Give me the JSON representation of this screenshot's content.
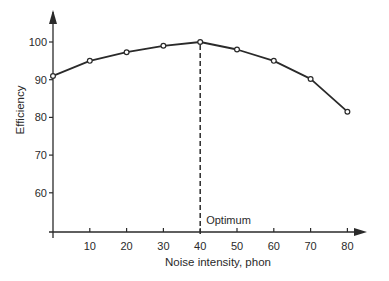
{
  "chart_data": {
    "type": "line",
    "title": "",
    "xlabel": "Noise intensity, phon",
    "ylabel": "Efficiency",
    "x": [
      0,
      10,
      20,
      30,
      40,
      50,
      60,
      70,
      80
    ],
    "series": [
      {
        "name": "Efficiency",
        "values": [
          91,
          95,
          97.3,
          99,
          100,
          98,
          95,
          90.2,
          81.5
        ]
      }
    ],
    "xticks": [
      10,
      20,
      30,
      40,
      50,
      60,
      70,
      80
    ],
    "yticks": [
      60,
      70,
      80,
      90,
      100
    ],
    "xlim": [
      0,
      85
    ],
    "ylim": [
      50,
      105
    ],
    "grid": false,
    "legend": false,
    "annotations": [
      {
        "text": "Optimum",
        "x": 40,
        "style": "dashed vertical line"
      }
    ],
    "marker": "open-circle",
    "line_color": "#2a2a2a"
  }
}
